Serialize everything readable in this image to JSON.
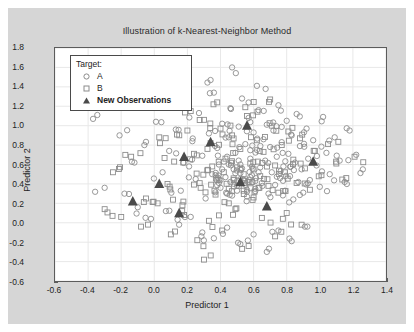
{
  "figure": {
    "title": "Illustration of k-Nearest-Neighbor Method",
    "background_color": "#d6d6d6",
    "plot_background_color": "#ffffff"
  },
  "legend": {
    "title": "Target:",
    "entries": [
      {
        "label": "A",
        "marker": "circle-marker",
        "bold": false
      },
      {
        "label": "B",
        "marker": "square-marker",
        "bold": false
      },
      {
        "label": "New Observations",
        "marker": "triangle-marker",
        "bold": true
      }
    ]
  },
  "chart_data": {
    "type": "scatter",
    "title": "Illustration of k-Nearest-Neighbor Method",
    "xlabel": "Predictor 1",
    "ylabel": "Predictor 2",
    "xlim": [
      -0.6,
      1.4
    ],
    "ylim": [
      -0.6,
      1.8
    ],
    "xticks": [
      "-0.6",
      "-0.4",
      "-0.2",
      "0.0",
      "0.2",
      "0.4",
      "0.6",
      "0.8",
      "1.0",
      "1.2",
      "1.4"
    ],
    "xtick_values": [
      -0.6,
      -0.4,
      -0.2,
      0.0,
      0.2,
      0.4,
      0.6,
      0.8,
      1.0,
      1.2,
      1.4
    ],
    "yticks": [
      "1.8",
      "1.6",
      "1.4",
      "1.2",
      "1.0",
      "0.8",
      "0.6",
      "0.4",
      "0.2",
      "0.0",
      "-0.2",
      "-0.4",
      "-0.6"
    ],
    "ytick_values": [
      1.8,
      1.6,
      1.4,
      1.2,
      1.0,
      0.8,
      0.6,
      0.4,
      0.2,
      0.0,
      -0.2,
      -0.4,
      -0.6
    ],
    "grid": true,
    "grid_color": "#e8e8e8",
    "legend_position": "upper-left",
    "marker_color": "#8c8c8c",
    "highlight_color": "#4a4a4a",
    "series": [
      {
        "name": "A",
        "marker": "circle",
        "point_count": 243,
        "points": [
          [
            -0.37,
            1.07
          ],
          [
            -0.21,
            0.9
          ],
          [
            -0.3,
            0.36
          ],
          [
            -0.18,
            0.3
          ],
          [
            -0.12,
            0.62
          ],
          [
            -0.06,
            0.8
          ],
          [
            0.01,
            1.04
          ],
          [
            0.05,
            0.52
          ],
          [
            0.09,
            0.74
          ],
          [
            0.13,
            0.96
          ],
          [
            0.16,
            0.33
          ],
          [
            0.18,
            1.25
          ],
          [
            0.21,
            0.58
          ],
          [
            0.23,
            0.84
          ],
          [
            0.25,
            0.45
          ],
          [
            0.27,
            1.13
          ],
          [
            0.29,
            0.69
          ],
          [
            0.31,
            0.25
          ],
          [
            0.33,
            0.92
          ],
          [
            0.35,
            0.5
          ],
          [
            0.36,
            1.34
          ],
          [
            0.38,
            0.77
          ],
          [
            0.39,
            0.41
          ],
          [
            0.41,
            1.02
          ],
          [
            0.42,
            0.63
          ],
          [
            0.44,
            0.3
          ],
          [
            0.45,
            0.88
          ],
          [
            0.46,
            1.18
          ],
          [
            0.48,
            0.55
          ],
          [
            0.49,
            0.72
          ],
          [
            0.5,
            0.38
          ],
          [
            0.51,
            0.99
          ],
          [
            0.52,
            0.6
          ],
          [
            0.53,
            1.28
          ],
          [
            0.54,
            0.44
          ],
          [
            0.55,
            0.81
          ],
          [
            0.56,
            0.27
          ],
          [
            0.57,
            1.08
          ],
          [
            0.58,
            0.66
          ],
          [
            0.59,
            0.49
          ],
          [
            0.6,
            0.93
          ],
          [
            0.61,
            0.35
          ],
          [
            0.62,
            0.75
          ],
          [
            0.63,
            1.16
          ],
          [
            0.64,
            0.57
          ],
          [
            0.65,
            0.41
          ],
          [
            0.66,
            0.86
          ],
          [
            0.67,
            0.64
          ],
          [
            0.68,
            1.01
          ],
          [
            0.69,
            0.3
          ],
          [
            0.7,
            0.78
          ],
          [
            0.71,
            0.52
          ],
          [
            0.72,
            0.95
          ],
          [
            0.73,
            0.39
          ],
          [
            0.74,
            0.68
          ],
          [
            0.75,
            1.21
          ],
          [
            0.76,
            0.46
          ],
          [
            0.77,
            0.83
          ],
          [
            0.78,
            0.58
          ],
          [
            0.79,
            0.33
          ],
          [
            0.8,
            1.05
          ],
          [
            0.81,
            0.71
          ],
          [
            0.82,
            0.48
          ],
          [
            0.83,
            0.9
          ],
          [
            0.84,
            0.24
          ],
          [
            0.85,
            0.62
          ],
          [
            0.86,
            1.12
          ],
          [
            0.87,
            0.42
          ],
          [
            0.88,
            0.79
          ],
          [
            0.89,
            0.55
          ],
          [
            0.9,
            0.31
          ],
          [
            0.92,
            0.97
          ],
          [
            0.93,
            0.66
          ],
          [
            0.94,
            0.44
          ],
          [
            0.96,
            0.85
          ],
          [
            0.98,
            0.59
          ],
          [
            1.0,
            0.37
          ],
          [
            1.02,
            1.09
          ],
          [
            1.04,
            0.72
          ],
          [
            1.06,
            0.5
          ],
          [
            1.09,
            0.88
          ],
          [
            1.12,
            0.64
          ],
          [
            1.15,
            0.42
          ],
          [
            1.18,
            0.95
          ],
          [
            1.22,
            0.7
          ],
          [
            1.26,
            0.55
          ],
          [
            0.29,
            -0.1
          ],
          [
            0.36,
            -0.16
          ],
          [
            0.44,
            -0.05
          ],
          [
            0.52,
            -0.22
          ],
          [
            0.6,
            -0.12
          ],
          [
            0.68,
            -0.3
          ],
          [
            0.75,
            -0.08
          ],
          [
            0.83,
            -0.19
          ],
          [
            0.91,
            -0.04
          ],
          [
            0.22,
            0.06
          ],
          [
            0.15,
            -0.02
          ],
          [
            0.07,
            0.12
          ],
          [
            -0.02,
            0.04
          ],
          [
            -0.1,
            0.16
          ],
          [
            0.05,
            1.38
          ],
          [
            0.34,
            1.47
          ],
          [
            0.62,
            1.41
          ],
          [
            0.47,
            1.6
          ],
          [
            0.19,
            1.3
          ],
          [
            0.43,
            0.47
          ],
          [
            0.46,
            0.42
          ],
          [
            0.49,
            0.51
          ],
          [
            0.52,
            0.45
          ],
          [
            0.55,
            0.39
          ],
          [
            0.41,
            0.55
          ],
          [
            0.5,
            0.33
          ],
          [
            0.58,
            0.47
          ],
          [
            0.45,
            0.6
          ],
          [
            0.53,
            0.56
          ],
          [
            0.37,
            0.49
          ],
          [
            0.4,
            0.36
          ],
          [
            0.47,
            0.28
          ],
          [
            0.56,
            0.34
          ],
          [
            0.61,
            0.43
          ],
          [
            0.63,
            0.52
          ],
          [
            0.59,
            0.58
          ],
          [
            0.51,
            0.64
          ],
          [
            0.44,
            0.68
          ],
          [
            0.39,
            0.6
          ]
        ]
      },
      {
        "name": "B",
        "marker": "square",
        "point_count": 181,
        "points": [
          [
            -0.25,
            0.52
          ],
          [
            -0.14,
            0.68
          ],
          [
            -0.05,
            0.25
          ],
          [
            0.03,
            0.88
          ],
          [
            0.08,
            0.4
          ],
          [
            0.12,
            0.63
          ],
          [
            0.17,
            0.18
          ],
          [
            0.2,
            0.95
          ],
          [
            0.24,
            0.71
          ],
          [
            0.28,
            0.36
          ],
          [
            0.3,
            1.06
          ],
          [
            0.32,
            0.54
          ],
          [
            0.34,
            0.82
          ],
          [
            0.37,
            0.29
          ],
          [
            0.4,
            0.97
          ],
          [
            0.43,
            0.66
          ],
          [
            0.45,
            0.2
          ],
          [
            0.47,
            0.9
          ],
          [
            0.5,
            0.57
          ],
          [
            0.52,
            0.76
          ],
          [
            0.54,
            0.33
          ],
          [
            0.56,
            1.1
          ],
          [
            0.58,
            0.61
          ],
          [
            0.6,
            0.26
          ],
          [
            0.62,
            0.85
          ],
          [
            0.64,
            0.48
          ],
          [
            0.66,
            0.73
          ],
          [
            0.69,
            0.38
          ],
          [
            0.71,
            1.0
          ],
          [
            0.73,
            0.59
          ],
          [
            0.75,
            0.31
          ],
          [
            0.77,
            0.8
          ],
          [
            0.79,
            0.52
          ],
          [
            0.81,
            0.94
          ],
          [
            0.84,
            0.65
          ],
          [
            0.86,
            0.41
          ],
          [
            0.88,
            0.87
          ],
          [
            0.91,
            0.56
          ],
          [
            0.94,
            0.34
          ],
          [
            0.97,
            0.74
          ],
          [
            1.01,
            0.49
          ],
          [
            1.05,
            0.81
          ],
          [
            1.1,
            0.61
          ],
          [
            1.16,
            0.46
          ],
          [
            1.21,
            0.68
          ],
          [
            -0.3,
            0.14
          ],
          [
            -0.2,
            0.06
          ],
          [
            -0.08,
            -0.04
          ],
          [
            0.02,
            0.2
          ],
          [
            0.1,
            -0.12
          ],
          [
            0.18,
            0.08
          ],
          [
            0.26,
            -0.18
          ],
          [
            0.33,
            0.02
          ],
          [
            0.41,
            -0.08
          ],
          [
            0.49,
            0.14
          ],
          [
            0.57,
            -0.24
          ],
          [
            0.65,
            0.05
          ],
          [
            0.73,
            -0.14
          ],
          [
            0.8,
            0.1
          ],
          [
            0.89,
            -0.02
          ],
          [
            0.48,
            0.44
          ],
          [
            0.51,
            0.38
          ],
          [
            0.54,
            0.5
          ],
          [
            0.57,
            0.42
          ],
          [
            0.6,
            0.55
          ],
          [
            0.45,
            0.35
          ],
          [
            0.42,
            0.52
          ],
          [
            0.38,
            0.44
          ],
          [
            0.35,
            0.58
          ],
          [
            0.63,
            0.36
          ],
          [
            0.22,
            1.15
          ],
          [
            0.38,
            1.24
          ],
          [
            0.55,
            1.19
          ],
          [
            0.7,
            1.27
          ],
          [
            0.3,
            -0.38
          ]
        ]
      },
      {
        "name": "New Observations",
        "marker": "triangle",
        "point_count": 9,
        "points": [
          [
            -0.13,
            0.22
          ],
          [
            0.03,
            0.4
          ],
          [
            0.18,
            0.68
          ],
          [
            0.15,
            0.1
          ],
          [
            0.34,
            0.83
          ],
          [
            0.56,
            1.0
          ],
          [
            0.52,
            0.42
          ],
          [
            0.68,
            0.17
          ],
          [
            0.96,
            0.63
          ]
        ]
      }
    ]
  }
}
